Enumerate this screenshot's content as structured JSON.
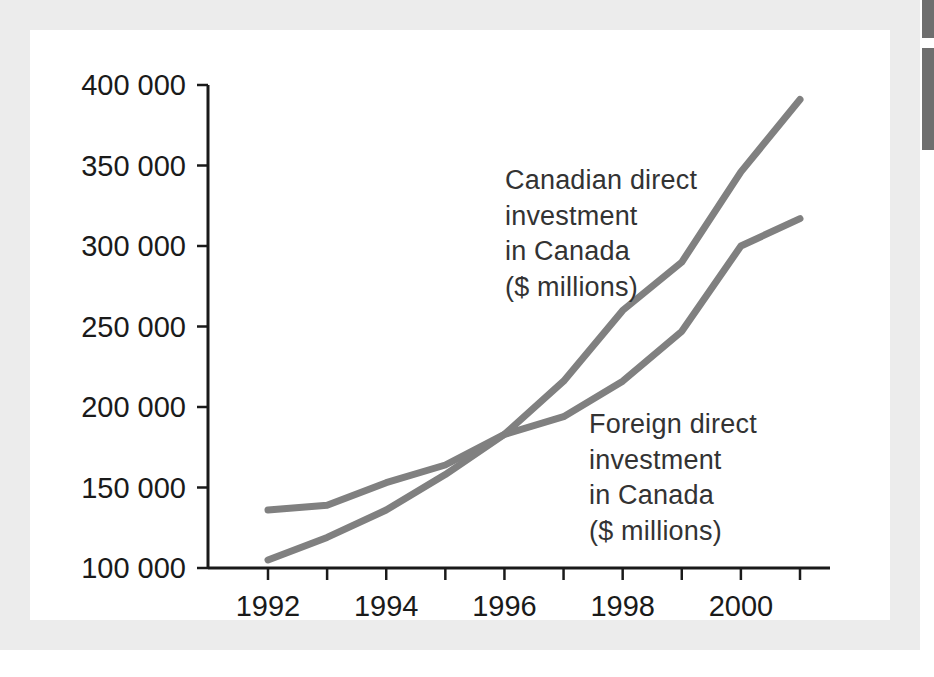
{
  "figure": {
    "background_color": "#ffffff",
    "mat_color": "#ececec",
    "plate_color": "#ffffff",
    "edge_bar_color": "#6e6e6e",
    "line_color": "#808080",
    "axis_color": "#1a1a1a",
    "text_color": "#333333"
  },
  "chart_data": {
    "type": "line",
    "title": "",
    "subtitle": "",
    "xlabel": "",
    "ylabel": "",
    "xlim": [
      1992,
      2001
    ],
    "ylim": [
      100000,
      400000
    ],
    "grid": false,
    "legend_position": "inline-annotations",
    "x": [
      1992,
      1993,
      1994,
      1995,
      1996,
      1997,
      1998,
      1999,
      2000,
      2001
    ],
    "x_tick_values": [
      1992,
      1993,
      1994,
      1995,
      1996,
      1997,
      1998,
      1999,
      2000,
      2001
    ],
    "x_tick_labels": [
      "1992",
      "",
      "1994",
      "",
      "1996",
      "",
      "1998",
      "",
      "2000",
      ""
    ],
    "y_tick_values": [
      100000,
      150000,
      200000,
      250000,
      300000,
      350000,
      400000
    ],
    "y_tick_labels": [
      "100 000",
      "150 000",
      "200 000",
      "250 000",
      "300 000",
      "350 000",
      "400 000"
    ],
    "series": [
      {
        "name": "Canadian direct investment in Canada ($ millions)",
        "color": "#808080",
        "values": [
          136000,
          139000,
          153000,
          164000,
          183000,
          216000,
          260000,
          290000,
          346000,
          391000
        ]
      },
      {
        "name": "Foreign direct investment in Canada ($ millions)",
        "color": "#808080",
        "values": [
          105000,
          119000,
          136000,
          158000,
          183000,
          194000,
          216000,
          247000,
          300000,
          317000
        ]
      }
    ],
    "annotations": [
      {
        "id": "canadian",
        "text": "Canadian direct\ninvestment\nin Canada\n($ millions)",
        "lines": [
          "Canadian direct",
          "investment",
          "in Canada",
          "($ millions)"
        ]
      },
      {
        "id": "foreign",
        "text": "Foreign direct\ninvestment\nin Canada\n($ millions)",
        "lines": [
          "Foreign direct",
          "investment",
          "in Canada",
          "($ millions)"
        ]
      }
    ]
  }
}
